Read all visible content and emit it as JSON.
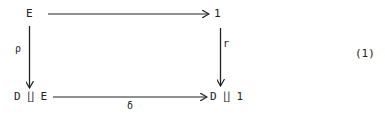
{
  "diagram": {
    "nodes": {
      "top_left": "E",
      "top_right": "1",
      "bottom_left": "D ∐ E",
      "bottom_right": "D ∐ 1"
    },
    "arrows": {
      "top": "",
      "left": "ρ",
      "right": "r",
      "bottom": "δ"
    },
    "equation_number": "(1)"
  }
}
